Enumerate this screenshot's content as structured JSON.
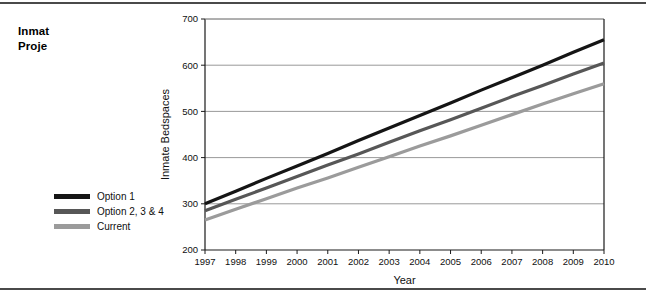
{
  "document": {
    "title_lines": [
      "Inmat",
      "Proje"
    ],
    "title_note": "clipped"
  },
  "legend": {
    "position": "bottom-left-outside",
    "items": [
      {
        "label": "Option 1",
        "color": "#151515"
      },
      {
        "label": "Option 2, 3 & 4",
        "color": "#575757"
      },
      {
        "label": "Current",
        "color": "#9b9b9b"
      }
    ]
  },
  "chart_data": {
    "type": "line",
    "title": "",
    "xlabel": "Year",
    "ylabel": "Inmate Bedspaces",
    "x": [
      1997,
      1998,
      1999,
      2000,
      2001,
      2002,
      2003,
      2004,
      2005,
      2006,
      2007,
      2008,
      2009,
      2010
    ],
    "xtick_labels": [
      "1997",
      "1998",
      "1999",
      "2000",
      "2001",
      "2002",
      "2003",
      "2004",
      "2005",
      "2006",
      "2007",
      "2008",
      "2009",
      "2010"
    ],
    "ylim": [
      200,
      700
    ],
    "yticks": [
      200,
      300,
      400,
      500,
      600,
      700
    ],
    "ytick_labels": [
      "200",
      "300",
      "400",
      "500",
      "600",
      "700"
    ],
    "grid": "horizontal",
    "legend_position": "outside-bottom-left",
    "series": [
      {
        "name": "Option 1",
        "color": "#151515",
        "values": [
          300,
          327,
          355,
          382,
          409,
          437,
          464,
          491,
          518,
          546,
          573,
          600,
          628,
          655
        ]
      },
      {
        "name": "Option 2, 3 & 4",
        "color": "#575757",
        "values": [
          285,
          310,
          334,
          359,
          384,
          408,
          433,
          458,
          482,
          507,
          532,
          556,
          581,
          605
        ]
      },
      {
        "name": "Current",
        "color": "#9b9b9b",
        "values": [
          265,
          288,
          311,
          334,
          356,
          379,
          402,
          425,
          447,
          470,
          493,
          516,
          538,
          560
        ]
      }
    ]
  }
}
